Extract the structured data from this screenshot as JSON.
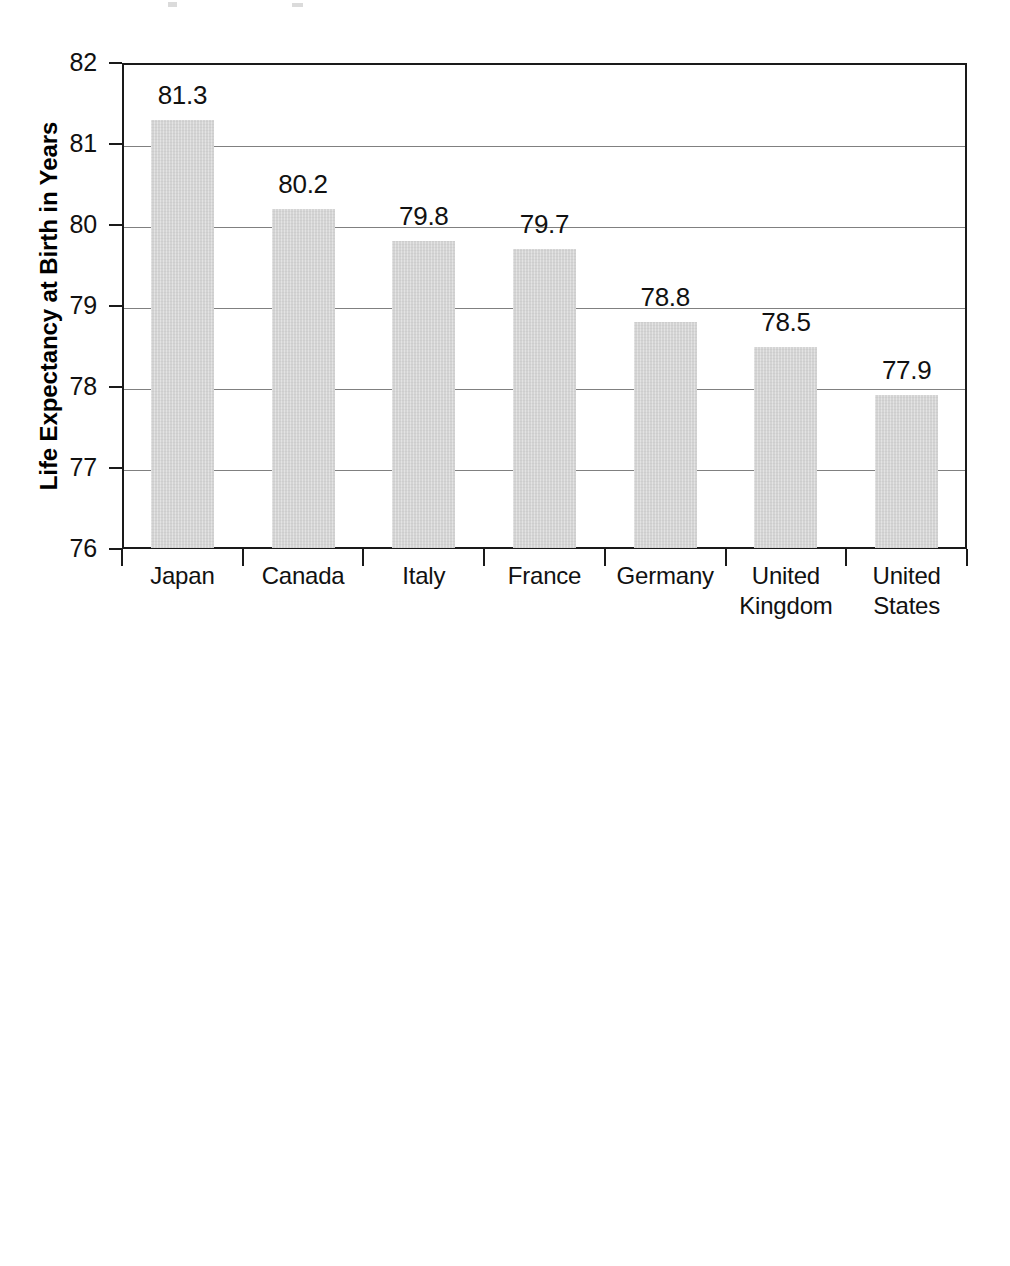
{
  "figure": {
    "background_color": "#ffffff",
    "bar_color": "#d4d4d4",
    "axis_color": "#1a1a1a",
    "grid_color": "#808080"
  },
  "chart_data": [
    {
      "id": "life-expectancy",
      "type": "bar",
      "title": "",
      "xlabel": "",
      "ylabel": "Life Expectancy at Birth in Years",
      "ylabel_lines": [
        "Life Expectancy at Birth in Years"
      ],
      "categories": [
        "Japan",
        "Canada",
        "Italy",
        "France",
        "Germany",
        "United Kingdom",
        "United States"
      ],
      "category_lines": [
        [
          "Japan"
        ],
        [
          "Canada"
        ],
        [
          "Italy"
        ],
        [
          "France"
        ],
        [
          "Germany"
        ],
        [
          "United",
          "Kingdom"
        ],
        [
          "United",
          "States"
        ]
      ],
      "values": [
        81.3,
        80.2,
        79.8,
        79.7,
        78.8,
        78.5,
        77.9
      ],
      "data_labels": [
        "81.3",
        "80.2",
        "79.8",
        "79.7",
        "78.8",
        "78.5",
        "77.9"
      ],
      "ylim": [
        76,
        82
      ],
      "yticks": [
        82,
        81,
        80,
        79,
        78,
        77,
        76
      ],
      "ytick_labels": [
        "82",
        "81",
        "80",
        "79",
        "78",
        "77",
        "76"
      ],
      "grid": true,
      "legend": "none"
    },
    {
      "id": "infant-mortality",
      "type": "bar",
      "title": "",
      "xlabel": "",
      "ylabel": "Infant Mortality Rate (deaths under 1 year per 1,000 live births)",
      "ylabel_lines": [
        "Infant Mortality Rate (deaths",
        "under 1 year per 1,000 live births)"
      ],
      "categories": [
        "Japan",
        "Germany",
        "France",
        "Canada",
        "United Kingdom",
        "Italy",
        "United States"
      ],
      "category_lines": [
        [
          "Japan"
        ],
        [
          "Germany"
        ],
        [
          "France"
        ],
        [
          "Canada"
        ],
        [
          "United",
          "Kingdom"
        ],
        [
          "Italy"
        ],
        [
          "United",
          "States"
        ]
      ],
      "values": [
        3.2,
        4.1,
        4.2,
        4.7,
        5.1,
        5.8,
        6.4
      ],
      "data_labels": [
        "3.2",
        "4.1",
        "4.2",
        "4.7",
        "5.1",
        "5.8",
        "6.4"
      ],
      "ylim": [
        0,
        7
      ],
      "yticks": [
        7,
        6,
        5,
        4,
        3,
        2,
        1,
        0
      ],
      "ytick_labels": [
        "7",
        "6",
        "5",
        "4",
        "3",
        "2",
        "1",
        "0"
      ],
      "grid": true,
      "legend": "none"
    }
  ]
}
